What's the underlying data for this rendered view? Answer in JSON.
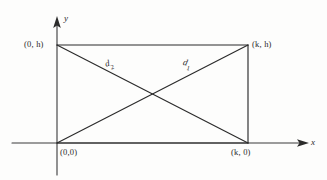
{
  "figure": {
    "colors": {
      "background": "#fdfdfc",
      "stroke": "#2b2b2b",
      "axis": "#3a3a3a"
    },
    "axes": {
      "x_label": "x",
      "y_label": "y",
      "x_axis": {
        "x1": 12,
        "y1": 143,
        "x2": 303,
        "y2": 143
      },
      "y_axis": {
        "x1": 57,
        "y1": 175,
        "x2": 57,
        "y2": 20
      }
    },
    "rectangle": {
      "top_left": {
        "x": 57,
        "y": 45
      },
      "top_right": {
        "x": 248,
        "y": 45
      },
      "bottom_right": {
        "x": 248,
        "y": 143
      },
      "bottom_left": {
        "x": 57,
        "y": 143
      }
    },
    "vertex_labels": {
      "top_left": "(0, h)",
      "top_right": "(k, h)",
      "bottom_left": "(0,0)",
      "bottom_right": "(k, 0)"
    },
    "diagonals": [
      {
        "name": "d1",
        "label_text": "d",
        "label_subscript": "1",
        "from": {
          "x": 57,
          "y": 143
        },
        "to": {
          "x": 248,
          "y": 45
        }
      },
      {
        "name": "d2",
        "label_text": "d",
        "label_subscript": "2",
        "from": {
          "x": 57,
          "y": 45
        },
        "to": {
          "x": 248,
          "y": 143
        }
      }
    ],
    "intersection": {
      "x": 152,
      "y": 94
    }
  }
}
